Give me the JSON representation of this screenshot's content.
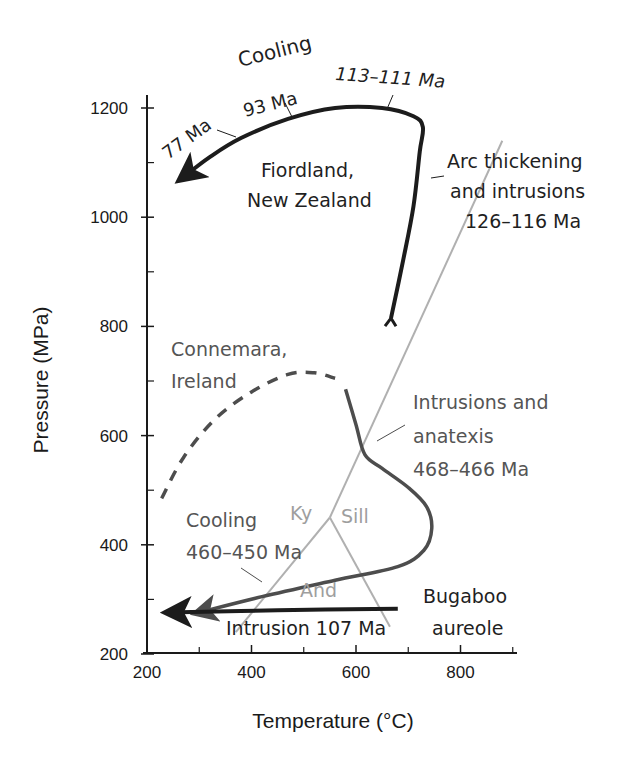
{
  "chart_data": {
    "type": "line",
    "title": "",
    "xlabel": "Temperature (°C)",
    "ylabel": "Pressure (MPa)",
    "xlim": [
      200,
      900
    ],
    "ylim": [
      200,
      1220
    ],
    "x_ticks_major": [
      200,
      400,
      600,
      800
    ],
    "x_ticks_minor": [
      300,
      500,
      700,
      900
    ],
    "y_ticks_major": [
      200,
      400,
      600,
      800,
      1000,
      1200
    ],
    "y_ticks_minor": [
      300,
      500,
      700,
      900,
      1100
    ],
    "grid": false,
    "legend": "none",
    "colors": {
      "fiordland": "#1c1c1c",
      "connemara": "#4d4d4d",
      "bugaboo": "#1c1c1c",
      "aluminosilicate": "#b0b0b0",
      "axis": "#1a1a1a"
    },
    "series": [
      {
        "name": "Fiordland, New Zealand",
        "style": "solid-thick-arrow",
        "points": [
          [
            667,
            815
          ],
          [
            690,
            920
          ],
          [
            710,
            1020
          ],
          [
            722,
            1120
          ],
          [
            728,
            1165
          ],
          [
            710,
            1185
          ],
          [
            650,
            1200
          ],
          [
            560,
            1200
          ],
          [
            470,
            1180
          ],
          [
            380,
            1145
          ],
          [
            320,
            1110
          ],
          [
            265,
            1070
          ]
        ]
      },
      {
        "name": "Connemara, Ireland (inferred prograde)",
        "style": "dashed",
        "points": [
          [
            228,
            485
          ],
          [
            270,
            560
          ],
          [
            330,
            630
          ],
          [
            400,
            680
          ],
          [
            470,
            712
          ],
          [
            520,
            715
          ],
          [
            560,
            705
          ]
        ]
      },
      {
        "name": "Connemara, Ireland",
        "style": "solid-arrow",
        "points": [
          [
            580,
            685
          ],
          [
            600,
            620
          ],
          [
            617,
            565
          ],
          [
            650,
            540
          ],
          [
            700,
            505
          ],
          [
            735,
            470
          ],
          [
            745,
            430
          ],
          [
            730,
            390
          ],
          [
            680,
            360
          ],
          [
            560,
            335
          ],
          [
            420,
            305
          ],
          [
            295,
            275
          ]
        ]
      },
      {
        "name": "Bugaboo aureole",
        "style": "solid-thick-arrow",
        "points": [
          [
            680,
            283
          ],
          [
            450,
            280
          ],
          [
            240,
            276
          ]
        ]
      }
    ],
    "phase_boundaries": [
      {
        "name": "Ky-Sill",
        "points": [
          [
            550,
            450
          ],
          [
            880,
            1140
          ]
        ]
      },
      {
        "name": "Ky-And",
        "points": [
          [
            550,
            450
          ],
          [
            370,
            240
          ]
        ]
      },
      {
        "name": "And-Sill",
        "points": [
          [
            550,
            450
          ],
          [
            665,
            250
          ]
        ]
      }
    ],
    "annotations": [
      {
        "id": "cooling-fiordland",
        "text": "Cooling",
        "tone": "dark"
      },
      {
        "id": "age-77",
        "text": "77 Ma",
        "tone": "dark"
      },
      {
        "id": "age-93",
        "text": "93 Ma",
        "tone": "dark"
      },
      {
        "id": "age-113",
        "text": "113–111 Ma",
        "tone": "dark"
      },
      {
        "id": "fiordland-1",
        "text": "Fiordland,",
        "tone": "dark"
      },
      {
        "id": "fiordland-2",
        "text": "New Zealand",
        "tone": "dark"
      },
      {
        "id": "arc-1",
        "text": "Arc thickening",
        "tone": "dark"
      },
      {
        "id": "arc-2",
        "text": "and intrusions",
        "tone": "dark"
      },
      {
        "id": "arc-3",
        "text": "126–116 Ma",
        "tone": "dark"
      },
      {
        "id": "connemara-1",
        "text": "Connemara,",
        "tone": "mid"
      },
      {
        "id": "connemara-2",
        "text": "Ireland",
        "tone": "mid"
      },
      {
        "id": "intr-1",
        "text": "Intrusions and",
        "tone": "mid"
      },
      {
        "id": "intr-2",
        "text": "anatexis",
        "tone": "mid"
      },
      {
        "id": "intr-3",
        "text": "468–466 Ma",
        "tone": "mid"
      },
      {
        "id": "cooling-connemara-1",
        "text": "Cooling",
        "tone": "mid"
      },
      {
        "id": "cooling-connemara-2",
        "text": "460–450 Ma",
        "tone": "mid"
      },
      {
        "id": "ky",
        "text": "Ky",
        "tone": "light"
      },
      {
        "id": "sill",
        "text": "Sill",
        "tone": "light"
      },
      {
        "id": "and",
        "text": "And",
        "tone": "light"
      },
      {
        "id": "bugaboo-1",
        "text": "Bugaboo",
        "tone": "dark"
      },
      {
        "id": "bugaboo-2",
        "text": "aureole",
        "tone": "dark"
      },
      {
        "id": "intrusion-107",
        "text": "Intrusion 107 Ma",
        "tone": "dark"
      }
    ]
  }
}
